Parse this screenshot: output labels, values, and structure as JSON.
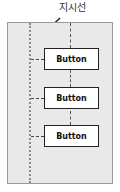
{
  "diagram": {
    "callout_label": "지시선",
    "buttons": [
      {
        "label": "Button"
      },
      {
        "label": "Button"
      },
      {
        "label": "Button"
      }
    ],
    "colors": {
      "panel_bg": "#e9e9e9",
      "panel_border": "#9a9a9a",
      "guide_line": "#8a8a8a",
      "button_bg": "#ffffff",
      "button_border": "#222222",
      "arrow": "#222222"
    }
  }
}
